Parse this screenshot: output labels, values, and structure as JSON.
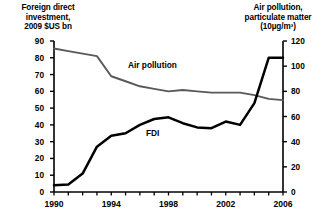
{
  "left_axis": {
    "title": "Foreign direct\ninvestment,\n2009 $US bn",
    "ticks": [
      "0",
      "10",
      "20",
      "30",
      "40",
      "50",
      "60",
      "70",
      "80",
      "90"
    ]
  },
  "right_axis": {
    "title": "Air pollution,\nparticulate matter\n(10µg/m³)",
    "ticks": [
      "0",
      "20",
      "40",
      "60",
      "80",
      "100",
      "120"
    ]
  },
  "x_axis": {
    "ticks": [
      "1990",
      "1994",
      "1998",
      "2002",
      "2006"
    ]
  },
  "series_labels": {
    "pollution": "Air pollution",
    "fdi": "FDI"
  },
  "colors": {
    "fdi_line": "#000000",
    "pollution_line": "#595959",
    "axis": "#000000",
    "background": "#ffffff"
  },
  "chart_data": {
    "type": "line",
    "title": "",
    "xlabel": "",
    "ylabel": "Foreign direct investment, 2009 $US bn",
    "y2label": "Air pollution, particulate matter (10µg/m³)",
    "x": [
      1990,
      1991,
      1992,
      1993,
      1994,
      1995,
      1996,
      1997,
      1998,
      1999,
      2000,
      2001,
      2002,
      2003,
      2004,
      2005,
      2006
    ],
    "xlim": [
      1990,
      2006
    ],
    "ylim": [
      0,
      90
    ],
    "y2lim": [
      0,
      120
    ],
    "grid": false,
    "legend_position": "inline-annotation",
    "series": [
      {
        "name": "FDI",
        "axis": "left",
        "values": [
          4,
          4.5,
          11,
          27,
          33.5,
          35,
          40,
          43.5,
          44.5,
          41,
          38.5,
          38,
          42,
          40,
          53,
          80,
          80
        ]
      },
      {
        "name": "Air pollution",
        "axis": "right",
        "values": [
          114,
          112,
          110,
          108,
          92,
          88,
          84,
          82,
          80,
          81,
          80,
          79,
          79,
          79,
          77,
          74,
          73
        ]
      }
    ],
    "series_left_scale_equivalent": [
      {
        "name": "Air pollution (plotted on right axis, left-scale pixels)",
        "values": [
          85.5,
          84,
          82.5,
          81,
          69,
          66,
          63,
          61.5,
          60,
          61,
          60,
          59.5,
          59.5,
          59,
          58,
          55.5,
          55
        ]
      }
    ]
  }
}
